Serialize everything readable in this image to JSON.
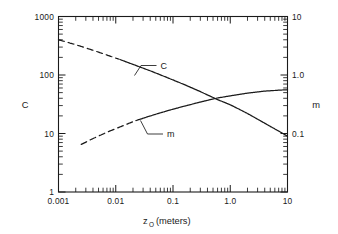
{
  "chart_data": {
    "type": "line",
    "title": "",
    "xlabel": "z_O (meters)",
    "xlabel_base": "z",
    "xlabel_sub": "O",
    "xlabel_rest": " (meters)",
    "ylabel_left": "C",
    "ylabel_right": "m",
    "xscale": "log",
    "yscale": "log",
    "xlim": [
      0.001,
      10
    ],
    "ylim_left": [
      1,
      1000
    ],
    "ylim_right": [
      0.01,
      10
    ],
    "grid": false,
    "legend": "none",
    "xticks": [
      0.001,
      0.01,
      0.1,
      1.0,
      10
    ],
    "xtick_labels": [
      "0.001",
      "0.01",
      "0.1",
      "1.0",
      "10"
    ],
    "yticks_left": [
      1,
      10,
      100,
      1000
    ],
    "ytick_labels_left": [
      "1",
      "10",
      "100",
      "1000"
    ],
    "yticks_right": [
      0.1,
      1.0,
      10
    ],
    "ytick_labels_right": [
      "0.1",
      "1.0",
      "10"
    ],
    "minor_ticks": true,
    "annotations": [
      {
        "text": "C",
        "x": 0.055,
        "y_axis": "left"
      },
      {
        "text": "m",
        "x": 0.09,
        "y_axis": "right"
      }
    ],
    "series": [
      {
        "name": "C",
        "label": "C",
        "axis": "left",
        "style": "solid-with-dashed-extrapolation",
        "dashed_range": [
          0.001,
          0.012
        ],
        "x": [
          0.001,
          0.002,
          0.004,
          0.008,
          0.012,
          0.02,
          0.04,
          0.08,
          0.15,
          0.3,
          0.6,
          1.0,
          2.0,
          4.0,
          7.0,
          10.0
        ],
        "y": [
          400,
          330,
          265,
          210,
          183,
          152,
          118,
          90,
          70,
          52,
          38,
          31,
          22,
          15,
          11,
          9
        ]
      },
      {
        "name": "m",
        "label": "m",
        "axis": "right",
        "style": "solid-with-dashed-extrapolation",
        "dashed_range": [
          0.0025,
          0.022
        ],
        "x": [
          0.0025,
          0.004,
          0.007,
          0.012,
          0.022,
          0.04,
          0.08,
          0.15,
          0.3,
          0.6,
          1.0,
          2.0,
          4.0,
          7.0,
          10.0
        ],
        "y": [
          0.065,
          0.082,
          0.105,
          0.13,
          0.165,
          0.2,
          0.245,
          0.29,
          0.345,
          0.405,
          0.44,
          0.49,
          0.53,
          0.55,
          0.56
        ]
      }
    ]
  },
  "axes": {
    "left_title": "C",
    "right_title": "m",
    "bottom_title_base": "z",
    "bottom_title_sub": "O",
    "bottom_title_rest": "(meters)"
  },
  "curve_labels": {
    "c": "C",
    "m": "m"
  }
}
